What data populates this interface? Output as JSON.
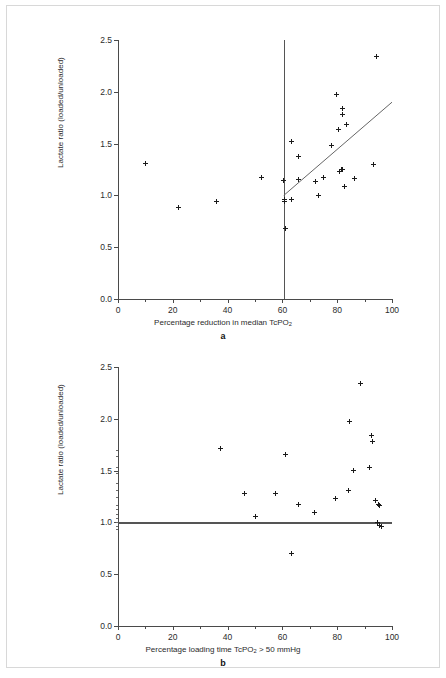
{
  "figure": {
    "panels": [
      "a",
      "b"
    ]
  },
  "chart_data": [
    {
      "type": "scatter",
      "panel_label": "a",
      "title": "",
      "xlabel": "Percentage reduction in median TcPO2",
      "xlabel_parts": {
        "pre": "Percentage reduction in median TcPO",
        "sub": "2",
        "post": ""
      },
      "ylabel": "Lactate ratio (loaded/unloaded)",
      "xlim": [
        0,
        100
      ],
      "ylim": [
        0.0,
        2.5
      ],
      "xticks": [
        0,
        20,
        40,
        60,
        80,
        100
      ],
      "xtick_labels": [
        "0",
        "20",
        "40",
        "60",
        "80",
        "100"
      ],
      "yticks": [
        0.0,
        0.5,
        1.0,
        1.5,
        2.0,
        2.5
      ],
      "ytick_labels": [
        "0.0",
        "0.5",
        "1.0",
        "1.5",
        "2.0",
        "2.5"
      ],
      "grid": false,
      "legend": "none",
      "marker": "plus",
      "points": [
        {
          "x": 10.2,
          "y": 1.31
        },
        {
          "x": 22.2,
          "y": 0.88
        },
        {
          "x": 36.1,
          "y": 0.94
        },
        {
          "x": 52.5,
          "y": 1.17
        },
        {
          "x": 60.5,
          "y": 1.14
        },
        {
          "x": 60.6,
          "y": 0.96
        },
        {
          "x": 60.7,
          "y": 0.94
        },
        {
          "x": 61.2,
          "y": 0.68
        },
        {
          "x": 63.3,
          "y": 1.52
        },
        {
          "x": 63.4,
          "y": 0.96
        },
        {
          "x": 65.8,
          "y": 1.38
        },
        {
          "x": 66.0,
          "y": 1.15
        },
        {
          "x": 72.0,
          "y": 1.13
        },
        {
          "x": 73.0,
          "y": 1.0
        },
        {
          "x": 75.0,
          "y": 1.17
        },
        {
          "x": 77.8,
          "y": 1.48
        },
        {
          "x": 79.9,
          "y": 1.97
        },
        {
          "x": 80.3,
          "y": 1.64
        },
        {
          "x": 80.8,
          "y": 1.23
        },
        {
          "x": 81.5,
          "y": 1.25
        },
        {
          "x": 81.8,
          "y": 1.25
        },
        {
          "x": 82.0,
          "y": 1.84
        },
        {
          "x": 82.1,
          "y": 1.78
        },
        {
          "x": 82.6,
          "y": 1.09
        },
        {
          "x": 83.4,
          "y": 1.68
        },
        {
          "x": 86.2,
          "y": 1.16
        },
        {
          "x": 93.2,
          "y": 1.3
        },
        {
          "x": 94.5,
          "y": 2.34
        }
      ],
      "reference_line_vertical": {
        "x": 60.5,
        "y0": 0.0,
        "y1": 2.5
      },
      "fit_line": {
        "x0": 60.5,
        "y0": 1.0,
        "x1": 100.0,
        "y1": 1.9
      }
    },
    {
      "type": "scatter",
      "panel_label": "b",
      "title": "",
      "xlabel": "Percentage loading time TcPO2 > 50 mmHg",
      "xlabel_parts": {
        "pre": "Percentage loading time TcPO",
        "sub": "2",
        "post": " > 50 mmHg"
      },
      "ylabel": "Lactate ratio (loaded/unloaded)",
      "xlim": [
        0,
        100
      ],
      "ylim": [
        0.0,
        2.5
      ],
      "xticks": [
        0,
        20,
        40,
        60,
        80,
        100
      ],
      "xtick_labels": [
        "0",
        "20",
        "40",
        "60",
        "80",
        "100"
      ],
      "yticks": [
        0.0,
        0.5,
        1.0,
        1.5,
        2.0,
        2.5
      ],
      "ytick_labels": [
        "0.0",
        "0.5",
        "1.0",
        "1.5",
        "2.0",
        "2.5"
      ],
      "yticks_minor": [
        0.94,
        0.97,
        1.0,
        1.04,
        1.08,
        1.13,
        1.17,
        1.25,
        1.31,
        1.38,
        1.48,
        1.53,
        1.64,
        1.7
      ],
      "grid": false,
      "legend": "none",
      "marker": "plus",
      "points": [
        {
          "x": 37.5,
          "y": 1.71
        },
        {
          "x": 46.3,
          "y": 1.28
        },
        {
          "x": 50.1,
          "y": 1.06
        },
        {
          "x": 57.6,
          "y": 1.28
        },
        {
          "x": 61.0,
          "y": 1.66
        },
        {
          "x": 63.2,
          "y": 0.7
        },
        {
          "x": 65.8,
          "y": 1.17
        },
        {
          "x": 71.8,
          "y": 1.1
        },
        {
          "x": 79.2,
          "y": 1.23
        },
        {
          "x": 84.0,
          "y": 1.31
        },
        {
          "x": 84.5,
          "y": 1.97
        },
        {
          "x": 86.1,
          "y": 1.5
        },
        {
          "x": 88.5,
          "y": 2.34
        },
        {
          "x": 91.8,
          "y": 1.53
        },
        {
          "x": 92.5,
          "y": 1.84
        },
        {
          "x": 92.8,
          "y": 1.78
        },
        {
          "x": 94.0,
          "y": 1.21
        },
        {
          "x": 94.6,
          "y": 1.0
        },
        {
          "x": 95.2,
          "y": 1.17
        },
        {
          "x": 95.4,
          "y": 1.16
        },
        {
          "x": 95.6,
          "y": 0.97
        },
        {
          "x": 96.0,
          "y": 0.96
        }
      ],
      "reference_line_horizontal": {
        "y": 1.0,
        "x0": 0.0,
        "x1": 100.0
      }
    }
  ]
}
